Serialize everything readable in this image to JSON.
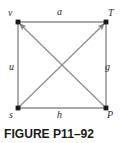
{
  "figure": {
    "caption": "FIGURE P11–92",
    "vertices": [
      {
        "id": "v",
        "label": "v",
        "position": "top-left"
      },
      {
        "id": "T",
        "label": "T",
        "position": "top-right"
      },
      {
        "id": "s",
        "label": "s",
        "position": "bottom-left"
      },
      {
        "id": "P",
        "label": "P",
        "position": "bottom-right"
      }
    ],
    "edges": [
      {
        "id": "a",
        "label": "a",
        "side": "top"
      },
      {
        "id": "u",
        "label": "u",
        "side": "left"
      },
      {
        "id": "g",
        "label": "g",
        "side": "right"
      },
      {
        "id": "h",
        "label": "h",
        "side": "bottom"
      }
    ],
    "diagonals": [
      {
        "id": "s-to-T",
        "from": "s",
        "to": "T",
        "arrowhead": "at-T"
      },
      {
        "id": "P-to-v",
        "from": "P",
        "to": "v",
        "arrowhead": "at-v"
      }
    ],
    "colors": {
      "line": "#8c8c8c",
      "vertex": "#1a1a1a",
      "label": "#2b2b2b",
      "caption": "#1a1a1a",
      "background": "#ffffff"
    }
  }
}
